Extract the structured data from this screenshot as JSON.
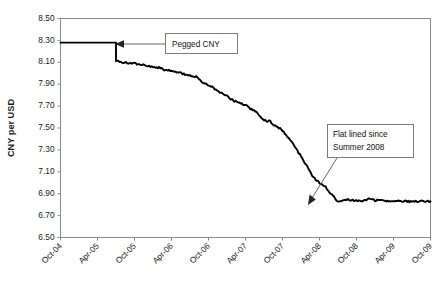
{
  "chart_data": {
    "type": "line",
    "title": "",
    "xlabel": "",
    "ylabel": "CNY per USD",
    "ylim": [
      6.5,
      8.5
    ],
    "ytick_step": 0.2,
    "ytick_labels": [
      "8.50",
      "8.30",
      "8.10",
      "7.90",
      "7.70",
      "7.50",
      "7.30",
      "7.10",
      "6.90",
      "6.70",
      "6.50"
    ],
    "ytick_values": [
      8.5,
      8.3,
      8.1,
      7.9,
      7.7,
      7.5,
      7.3,
      7.1,
      6.9,
      6.7,
      6.5
    ],
    "xtick_labels": [
      "Oct-04",
      "Apr-05",
      "Oct-05",
      "Apr-06",
      "Oct-06",
      "Apr-07",
      "Oct-07",
      "Apr-08",
      "Oct-08",
      "Apr-09",
      "Oct-09"
    ],
    "xlim_labels": [
      "Oct-04",
      "Oct-09"
    ],
    "grid": false,
    "legend": false,
    "legend_position": "none",
    "line_color": "#000000",
    "series": [
      {
        "name": "CNY per USD",
        "x": [
          "Oct-04",
          "Nov-04",
          "Dec-04",
          "Jan-05",
          "Feb-05",
          "Mar-05",
          "Apr-05",
          "May-05",
          "Jun-05",
          "Jul-05",
          "Aug-05",
          "Sep-05",
          "Oct-05",
          "Nov-05",
          "Dec-05",
          "Jan-06",
          "Feb-06",
          "Mar-06",
          "Apr-06",
          "May-06",
          "Jun-06",
          "Jul-06",
          "Aug-06",
          "Sep-06",
          "Oct-06",
          "Nov-06",
          "Dec-06",
          "Jan-07",
          "Feb-07",
          "Mar-07",
          "Apr-07",
          "May-07",
          "Jun-07",
          "Jul-07",
          "Aug-07",
          "Sep-07",
          "Oct-07",
          "Nov-07",
          "Dec-07",
          "Jan-08",
          "Feb-08",
          "Mar-08",
          "Apr-08",
          "May-08",
          "Jun-08",
          "Jul-08",
          "Aug-08",
          "Sep-08",
          "Oct-08",
          "Nov-08",
          "Dec-08",
          "Jan-09",
          "Feb-09",
          "Mar-09",
          "Apr-09",
          "May-09",
          "Jun-09",
          "Jul-09",
          "Aug-09",
          "Sep-09",
          "Oct-09"
        ],
        "values": [
          8.28,
          8.28,
          8.28,
          8.28,
          8.28,
          8.28,
          8.28,
          8.28,
          8.28,
          8.11,
          8.1,
          8.09,
          8.09,
          8.08,
          8.07,
          8.06,
          8.05,
          8.03,
          8.02,
          8.01,
          7.99,
          7.98,
          7.97,
          7.92,
          7.89,
          7.86,
          7.82,
          7.79,
          7.75,
          7.73,
          7.71,
          7.67,
          7.63,
          7.57,
          7.56,
          7.51,
          7.48,
          7.41,
          7.33,
          7.24,
          7.15,
          7.05,
          7.0,
          6.96,
          6.89,
          6.83,
          6.85,
          6.84,
          6.84,
          6.83,
          6.85,
          6.84,
          6.84,
          6.83,
          6.83,
          6.83,
          6.83,
          6.83,
          6.83,
          6.83,
          6.83
        ]
      }
    ],
    "annotations": [
      {
        "id": "pegged-cny",
        "text_lines": [
          "Pegged CNY"
        ],
        "points_to": {
          "x": "Mar-05",
          "y": 8.28
        },
        "arrow_direction": "left"
      },
      {
        "id": "flat-lined",
        "text_lines": [
          "Flat lined since",
          "Summer 2008"
        ],
        "points_to": {
          "x": "Aug-08",
          "y": 6.86
        },
        "arrow_direction": "down-left"
      }
    ]
  }
}
